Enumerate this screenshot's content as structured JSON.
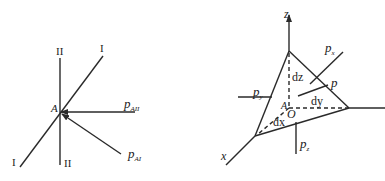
{
  "left_figure": {
    "point_label": "A",
    "plane_I_top": "I",
    "plane_I_bottom": "I",
    "plane_II_top": "II",
    "plane_II_bottom": "II",
    "stress_II": {
      "symbol": "p",
      "subscript": "AII"
    },
    "stress_I": {
      "symbol": "p",
      "subscript": "AI"
    }
  },
  "right_figure": {
    "axis_z": "z",
    "axis_x": "x",
    "point_A": "A",
    "origin": "O",
    "edge_dz": "dz",
    "edge_dy": "dy",
    "edge_dx": "dx",
    "stress_p": "p",
    "stress_px": {
      "symbol": "p",
      "subscript": "x"
    },
    "stress_py": {
      "symbol": "p",
      "subscript": "y"
    },
    "stress_pz": {
      "symbol": "p",
      "subscript": "z"
    }
  },
  "colors": {
    "line": "#2a2a2a",
    "background": "#ffffff"
  }
}
